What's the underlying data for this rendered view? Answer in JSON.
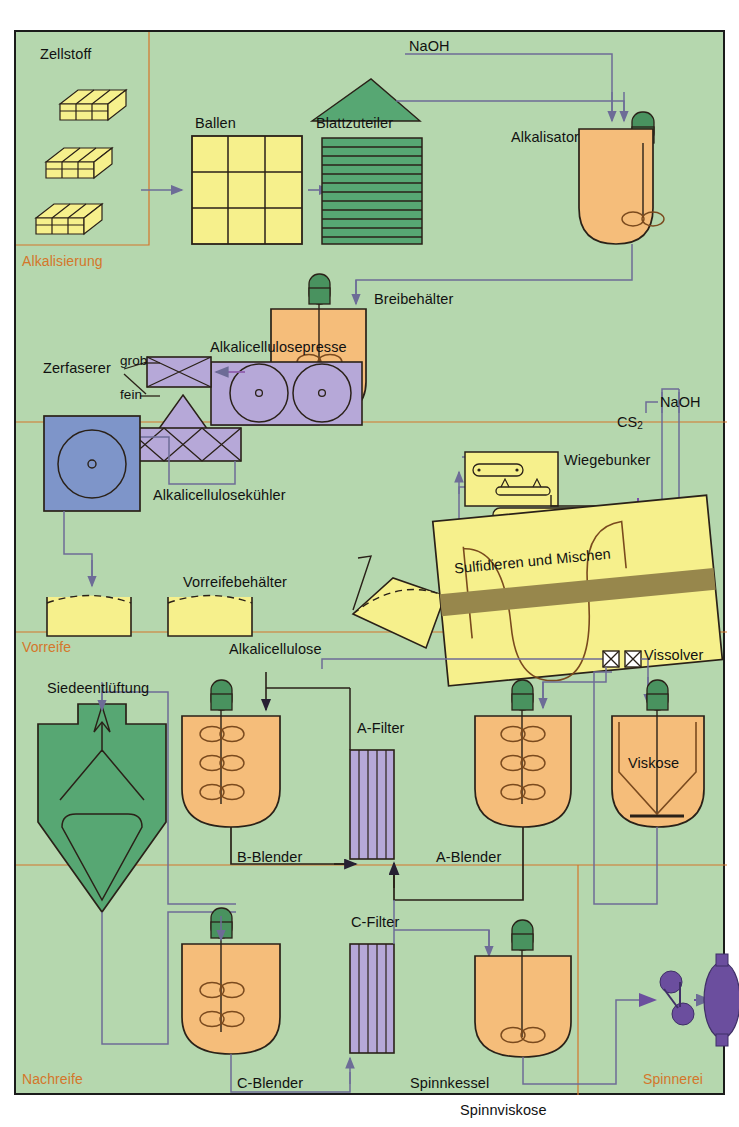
{
  "diagram": {
    "background_color": "#b5d7ae",
    "frame_color": "#1b1b1b"
  },
  "sections": [
    {
      "id": "alkalisierung",
      "label": "Alkalisierung",
      "color": "#d4762a"
    },
    {
      "id": "vorreife",
      "label": "Vorreife",
      "color": "#d4762a"
    },
    {
      "id": "nachreife",
      "label": "Nachreife",
      "color": "#d4762a"
    },
    {
      "id": "spinnerei",
      "label": "Spinnerei",
      "color": "#d4762a"
    }
  ],
  "labels": {
    "zellstoff": "Zellstoff",
    "ballen": "Ballen",
    "blattzuteiler": "Blattzuteiler",
    "naoh_top": "NaOH",
    "alkalisator": "Alkalisator",
    "breibehaelter": "Breibehälter",
    "alkalicellulosepresse": "Alkalicellulosepresse",
    "zerfaserer": "Zerfaserer",
    "grob": "grob",
    "fein": "fein",
    "alkalicellulosekuehler": "Alkalicellulosekühler",
    "vorreifebehaelter": "Vorreifebehälter",
    "alkalicellulose": "Alkalicellulose",
    "wiegebunker": "Wiegebunker",
    "cs2": "CS",
    "cs2_sub": "2",
    "naoh_mid": "NaOH",
    "sulfidieren": "Sulfidieren und Mischen",
    "vissolver": "Vissolver",
    "siedeentlueftung": "Siedeentlüftung",
    "b_blender": "B-Blender",
    "a_filter": "A-Filter",
    "a_blender": "A-Blender",
    "viskose": "Viskose",
    "c_filter": "C-Filter",
    "c_blender": "C-Blender",
    "spinnkessel": "Spinnkessel",
    "spinnviskose": "Spinnviskose"
  },
  "colors": {
    "pulp_yellow": "#f6f08c",
    "vessel_orange": "#f5bd7a",
    "green_dark": "#57a773",
    "green_motor": "#49925f",
    "purple": "#b6a8d8",
    "purple_dark": "#6b4e9e",
    "blue_cooler": "#7e95c9",
    "pipe": "#7b7aa8",
    "outline": "#2a2118",
    "band_olive": "#97874c"
  },
  "equipment": [
    {
      "name": "zellstoff-bale",
      "count": 3,
      "color": "#f6f08c"
    },
    {
      "name": "ballen-stack",
      "grid": "3x3",
      "color": "#f6f08c"
    },
    {
      "name": "blattzuteiler",
      "sheets": 12,
      "color": "#57a773"
    },
    {
      "name": "alkalisator-vessel",
      "agitators": 1,
      "color": "#f5bd7a"
    },
    {
      "name": "breibehaelter-vessel",
      "agitators": 2,
      "color": "#f5bd7a"
    },
    {
      "name": "alkalicellulosepresse",
      "rollers": 2,
      "color": "#b6a8d8"
    },
    {
      "name": "zerfaserer-grob",
      "color": "#b6a8d8"
    },
    {
      "name": "zerfaserer-fein",
      "color": "#b6a8d8"
    },
    {
      "name": "alkalicellulosekuehler",
      "color": "#7e95c9"
    },
    {
      "name": "vorreifebehaelter",
      "count": 3,
      "color": "#f6f08c"
    },
    {
      "name": "wiegebunker",
      "color": "#f6f08c"
    },
    {
      "name": "sulfidieren-mischer",
      "color": "#f6f08c"
    },
    {
      "name": "siedeentlueftung",
      "color": "#57a773"
    },
    {
      "name": "b-blender-vessel",
      "agitators": 3,
      "color": "#f5bd7a"
    },
    {
      "name": "a-filter",
      "stripes": 5,
      "color": "#b6a8d8"
    },
    {
      "name": "a-blender-vessel",
      "agitators": 3,
      "color": "#f5bd7a"
    },
    {
      "name": "viskose-vessel",
      "agitators": 1,
      "color": "#f5bd7a"
    },
    {
      "name": "c-filter",
      "stripes": 5,
      "color": "#b6a8d8"
    },
    {
      "name": "c-blender-vessel",
      "agitators": 2,
      "color": "#f5bd7a"
    },
    {
      "name": "spinnkessel-vessel",
      "agitators": 1,
      "color": "#f5bd7a"
    },
    {
      "name": "spinning-head",
      "color": "#6b4e9e"
    },
    {
      "name": "spinning-spool",
      "color": "#6b4e9e"
    }
  ]
}
